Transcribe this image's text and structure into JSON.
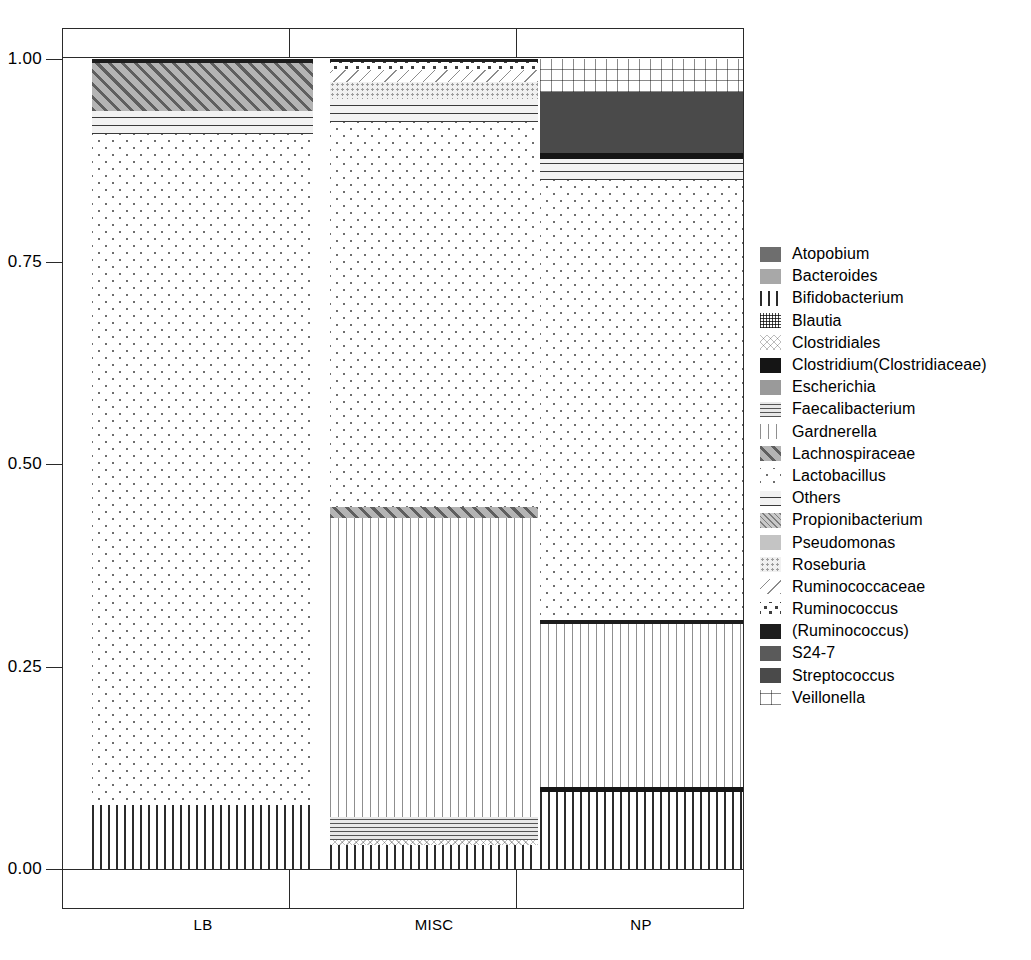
{
  "chart_data": {
    "type": "bar",
    "subtype": "stacked-proportional",
    "title": "",
    "xlabel": "",
    "ylabel": "",
    "ylim": [
      0.0,
      1.0
    ],
    "ytick_labels": [
      "0.00",
      "0.25",
      "0.50",
      "0.75",
      "1.00"
    ],
    "ytick_values": [
      0.0,
      0.25,
      0.5,
      0.75,
      1.0
    ],
    "grid": false,
    "legend_position": "right",
    "categories": [
      "LB",
      "MISC",
      "NP"
    ],
    "series": [
      {
        "name": "Atopobium",
        "values": [
          0.0,
          0.0,
          0.0
        ]
      },
      {
        "name": "Bacteroides",
        "values": [
          0.0,
          0.0,
          0.0
        ]
      },
      {
        "name": "Bifidobacterium",
        "values": [
          0.079,
          0.03,
          0.095
        ]
      },
      {
        "name": "Blautia",
        "values": [
          0.0,
          0.0,
          0.0
        ]
      },
      {
        "name": "Clostridiales",
        "values": [
          0.0,
          0.006,
          0.0
        ]
      },
      {
        "name": "Clostridium(Clostridiaceae)",
        "values": [
          0.0,
          0.0,
          0.006
        ]
      },
      {
        "name": "Escherichia",
        "values": [
          0.0,
          0.0,
          0.0
        ]
      },
      {
        "name": "Faecalibacterium",
        "values": [
          0.0,
          0.028,
          0.0
        ]
      },
      {
        "name": "Gardnerella",
        "values": [
          0.0,
          0.376,
          0.201
        ]
      },
      {
        "name": "Lachnospiraceae",
        "values": [
          0.027,
          0.011,
          0.0
        ]
      },
      {
        "name": "Lactobacillus",
        "values": [
          0.829,
          0.475,
          0.572
        ]
      },
      {
        "name": "Others",
        "values": [
          0.028,
          0.029,
          0.026
        ]
      },
      {
        "name": "Propionibacterium",
        "values": [
          0.0,
          0.0,
          0.0
        ]
      },
      {
        "name": "Pseudomonas",
        "values": [
          0.0,
          0.0,
          0.0
        ]
      },
      {
        "name": "Roseburia",
        "values": [
          0.0,
          0.021,
          0.0
        ]
      },
      {
        "name": "Ruminococcaceae",
        "values": [
          0.0,
          0.014,
          0.0
        ]
      },
      {
        "name": "Ruminococcus",
        "values": [
          0.0,
          0.006,
          0.0
        ]
      },
      {
        "name": "(Ruminococcus)",
        "values": [
          0.005,
          0.004,
          0.005
        ]
      },
      {
        "name": "S24-7",
        "values": [
          0.0,
          0.0,
          0.0
        ]
      },
      {
        "name": "Streptococcus",
        "values": [
          0.0,
          0.0,
          0.077
        ]
      },
      {
        "name": "Veillonella",
        "values": [
          0.0,
          0.0,
          0.041
        ]
      }
    ]
  },
  "axis": {
    "y_labels": [
      {
        "text": "1.00",
        "value": 1.0
      },
      {
        "text": "0.75",
        "value": 0.75
      },
      {
        "text": "0.50",
        "value": 0.5
      },
      {
        "text": "0.25",
        "value": 0.25
      },
      {
        "text": "0.00",
        "value": 0.0
      }
    ],
    "x_labels": [
      "LB",
      "MISC",
      "NP"
    ]
  },
  "legend": {
    "items": [
      {
        "label": "Atopobium",
        "pattern": "solid-medium-gray",
        "class": "p-atopobium"
      },
      {
        "label": "Bacteroides",
        "pattern": "solid-light-gray",
        "class": "p-bacteroides"
      },
      {
        "label": "Bifidobacterium",
        "pattern": "thick-vertical-bars",
        "class": "p-bifidobacterium"
      },
      {
        "label": "Blautia",
        "pattern": "fine-grid",
        "class": "p-blautia"
      },
      {
        "label": "Clostridiales",
        "pattern": "fine-crosshatch",
        "class": "p-clostridiales"
      },
      {
        "label": "Clostridium(Clostridiaceae)",
        "pattern": "solid-black",
        "class": "p-clostridium"
      },
      {
        "label": "Escherichia",
        "pattern": "solid-gray",
        "class": "p-escherichia"
      },
      {
        "label": "Faecalibacterium",
        "pattern": "horizontal-lines-dense",
        "class": "p-faecalibacterium"
      },
      {
        "label": "Gardnerella",
        "pattern": "thin-vertical-lines",
        "class": "p-gardnerella"
      },
      {
        "label": "Lachnospiraceae",
        "pattern": "diagonal-hatch-up",
        "class": "p-lachnospiraceae"
      },
      {
        "label": "Lactobacillus",
        "pattern": "sparse-dots",
        "class": "p-lactobacillus"
      },
      {
        "label": "Others",
        "pattern": "horizontal-lines",
        "class": "p-others"
      },
      {
        "label": "Propionibacterium",
        "pattern": "diagonal-fine-up",
        "class": "p-propionibacterium"
      },
      {
        "label": "Pseudomonas",
        "pattern": "solid-pale-gray",
        "class": "p-pseudomonas"
      },
      {
        "label": "Roseburia",
        "pattern": "fine-stipple",
        "class": "p-roseburia"
      },
      {
        "label": "Ruminococcaceae",
        "pattern": "diagonal-lines-down",
        "class": "p-ruminococcaceae"
      },
      {
        "label": "Ruminococcus",
        "pattern": "bold-dots",
        "class": "p-ruminococcus"
      },
      {
        "label": "(Ruminococcus)",
        "pattern": "solid-near-black",
        "class": "p-ruminococcus-p"
      },
      {
        "label": "S24-7",
        "pattern": "solid-dark-gray",
        "class": "p-s247"
      },
      {
        "label": "Streptococcus",
        "pattern": "solid-darker-gray",
        "class": "p-streptococcus"
      },
      {
        "label": "Veillonella",
        "pattern": "grid-crosshatch",
        "class": "p-veillonella"
      }
    ]
  },
  "bars": [
    {
      "category": "LB",
      "segments": [
        {
          "label": "Bifidobacterium",
          "class": "p-bifidobacterium",
          "from": 0.0,
          "to": 0.079
        },
        {
          "label": "Lactobacillus",
          "class": "p-lactobacillus",
          "from": 0.079,
          "to": 0.908
        },
        {
          "label": "Others",
          "class": "p-others",
          "from": 0.908,
          "to": 0.936
        },
        {
          "label": "Lachnospiraceae",
          "class": "p-lachnospiraceae",
          "from": 0.936,
          "to": 0.995
        },
        {
          "label": "(Ruminococcus)",
          "class": "p-ruminococcus-p",
          "from": 0.995,
          "to": 1.0
        }
      ]
    },
    {
      "category": "MISC",
      "segments": [
        {
          "label": "Bifidobacterium",
          "class": "p-bifidobacterium",
          "from": 0.0,
          "to": 0.03
        },
        {
          "label": "Clostridiales",
          "class": "p-clostridiales",
          "from": 0.03,
          "to": 0.036
        },
        {
          "label": "Faecalibacterium",
          "class": "p-faecalibacterium",
          "from": 0.036,
          "to": 0.064
        },
        {
          "label": "Gardnerella",
          "class": "p-gardnerella",
          "from": 0.064,
          "to": 0.433
        },
        {
          "label": "Lachnospiraceae",
          "class": "p-lachnospiraceae",
          "from": 0.433,
          "to": 0.447
        },
        {
          "label": "Lactobacillus",
          "class": "p-lactobacillus",
          "from": 0.447,
          "to": 0.922
        },
        {
          "label": "Others",
          "class": "p-others",
          "from": 0.922,
          "to": 0.951
        },
        {
          "label": "Roseburia",
          "class": "p-roseburia",
          "from": 0.951,
          "to": 0.972
        },
        {
          "label": "Ruminococcaceae",
          "class": "p-ruminococcaceae",
          "from": 0.972,
          "to": 0.986
        },
        {
          "label": "Ruminococcus",
          "class": "p-ruminococcus",
          "from": 0.986,
          "to": 0.996
        },
        {
          "label": "(Ruminococcus)",
          "class": "p-ruminococcus-p",
          "from": 0.996,
          "to": 1.0
        }
      ]
    },
    {
      "category": "NP",
      "segments": [
        {
          "label": "Bifidobacterium",
          "class": "p-bifidobacterium",
          "from": 0.0,
          "to": 0.095
        },
        {
          "label": "Clostridium(Clostridiaceae)",
          "class": "p-clostridium",
          "from": 0.095,
          "to": 0.101
        },
        {
          "label": "Gardnerella",
          "class": "p-gardnerella",
          "from": 0.101,
          "to": 0.302
        },
        {
          "label": "(Ruminococcus)",
          "class": "p-ruminococcus-p",
          "from": 0.302,
          "to": 0.307
        },
        {
          "label": "Lactobacillus",
          "class": "p-lactobacillus",
          "from": 0.307,
          "to": 0.851
        },
        {
          "label": "Others",
          "class": "p-others",
          "from": 0.851,
          "to": 0.877
        },
        {
          "label": "Clostridium(Clostridiaceae)",
          "class": "p-clostridium",
          "from": 0.877,
          "to": 0.884
        },
        {
          "label": "Streptococcus",
          "class": "p-streptococcus",
          "from": 0.884,
          "to": 0.959
        },
        {
          "label": "Veillonella",
          "class": "p-veillonella",
          "from": 0.959,
          "to": 1.0
        }
      ]
    }
  ]
}
